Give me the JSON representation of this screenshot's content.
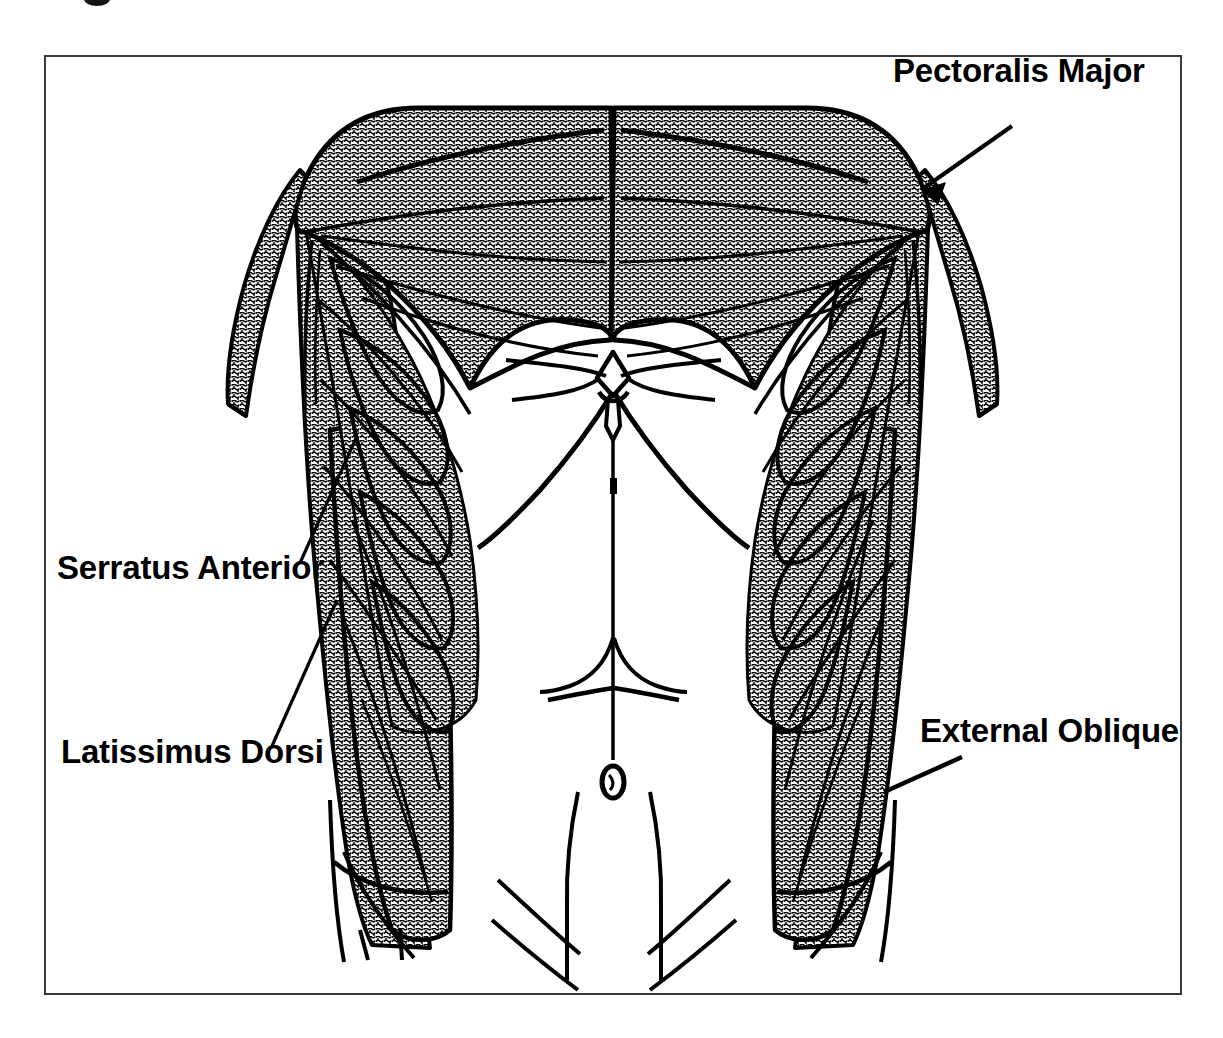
{
  "figure": {
    "style": {
      "background_color": "#ffffff",
      "frame_border_color": "#3a3a3a",
      "outline_color": "#000000",
      "muscle_fill": "stipple-dot-pattern",
      "muscle_fill_tone": "#9a9a9a",
      "label_color": "#000000"
    },
    "labels": [
      {
        "id": "pectoralis-major",
        "text": "Pectoralis Major",
        "position": "top-right",
        "leader_from": [
          930,
          92
        ],
        "leader_to": [
          1010,
          128
        ]
      },
      {
        "id": "serratus-anterior",
        "text": "Serratus Anterior",
        "position": "middle-left",
        "leader_from": [
          300,
          563
        ],
        "leader_to": [
          352,
          440
        ]
      },
      {
        "id": "latissimus-dorsi",
        "text": "Latissimus Dorsi",
        "position": "lower-left",
        "leader_from": [
          272,
          745
        ],
        "leader_to": [
          334,
          605
        ]
      },
      {
        "id": "external-oblique",
        "text": "External Oblique",
        "position": "lower-right",
        "leader_from": [
          960,
          760
        ],
        "leader_to": [
          888,
          790
        ]
      }
    ],
    "muscles": [
      {
        "id": "pectoralis-major",
        "label": "Pectoralis Major",
        "side": "bilateral",
        "shaded": true
      },
      {
        "id": "serratus-anterior",
        "label": "Serratus Anterior",
        "side": "bilateral",
        "shaded": true
      },
      {
        "id": "latissimus-dorsi",
        "label": "Latissimus Dorsi",
        "side": "bilateral",
        "shaded": true
      },
      {
        "id": "external-oblique",
        "label": "External Oblique",
        "side": "bilateral",
        "shaded": true
      }
    ],
    "unlabeled_features": [
      "sternum",
      "linea alba",
      "rectus abdominis tendinous intersections",
      "navel",
      "costal margin / rib cage outline",
      "iliac crest",
      "inguinal ligament lines",
      "upper arm stumps"
    ]
  }
}
